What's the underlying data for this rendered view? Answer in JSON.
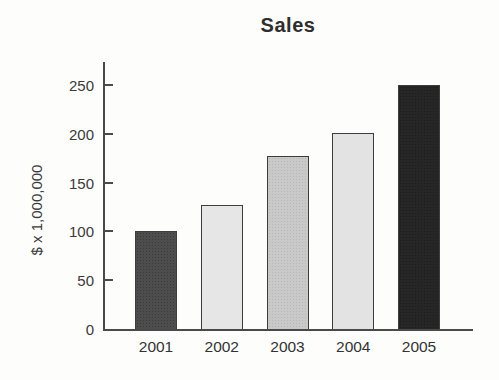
{
  "figure": {
    "title": "Sales"
  },
  "chart_data": {
    "type": "bar",
    "title": "Sales",
    "categories": [
      "2001",
      "2002",
      "2003",
      "2004",
      "2005"
    ],
    "values": [
      100,
      127,
      177,
      201,
      250
    ],
    "xlabel": "",
    "ylabel": "$ x 1,000,000",
    "ylim": [
      0,
      275
    ],
    "yticks": [
      0,
      50,
      100,
      150,
      200,
      250
    ],
    "grid": false,
    "legend": "none",
    "bar_colors": [
      "#4d4d4d",
      "#e6e6e6",
      "#c9c9c9",
      "#e3e3e3",
      "#262626"
    ],
    "bar_patterns": [
      "noise",
      "none",
      "halftone",
      "none",
      "noise"
    ],
    "bar_border_color": "#3d3d3d",
    "axis_color": "#4a4a4a",
    "text_color": "#3a3a3a"
  }
}
